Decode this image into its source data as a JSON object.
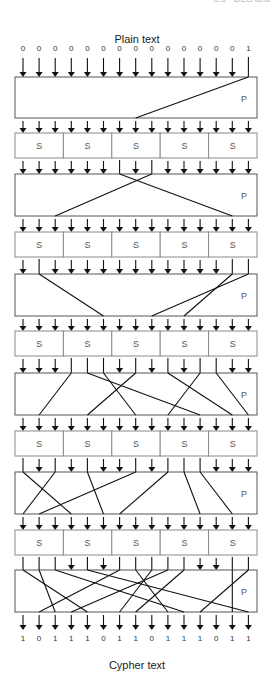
{
  "header": {
    "cut_text": "3.5 · DES and"
  },
  "diagram": {
    "title_top": "Plain text",
    "title_bottom": "Cypher text",
    "plaintext_bits": [
      "0",
      "0",
      "0",
      "0",
      "0",
      "0",
      "0",
      "0",
      "0",
      "0",
      "0",
      "0",
      "0",
      "0",
      "1"
    ],
    "cyphertext_bits": [
      "1",
      "0",
      "1",
      "1",
      "1",
      "0",
      "1",
      "1",
      "0",
      "1",
      "1",
      "1",
      "0",
      "1",
      "1"
    ],
    "sbox_label": "S",
    "pbox_label": "P",
    "wire_count": 15,
    "sboxes_per_round": 5,
    "rounds": [
      {
        "type": "P",
        "y": 77,
        "h": 41,
        "routes": [
          [
            14,
            7
          ]
        ]
      },
      {
        "type": "S",
        "y": 133,
        "h": 25
      },
      {
        "type": "P",
        "y": 174,
        "h": 42,
        "routes": [
          [
            6,
            13
          ],
          [
            8,
            2
          ]
        ]
      },
      {
        "type": "S",
        "y": 232,
        "h": 25
      },
      {
        "type": "P",
        "y": 274,
        "h": 42,
        "routes": [
          [
            1,
            5
          ],
          [
            13,
            10
          ],
          [
            14,
            8
          ]
        ]
      },
      {
        "type": "S",
        "y": 331,
        "h": 25
      },
      {
        "type": "P",
        "y": 373,
        "h": 42,
        "routes": [
          [
            3,
            1
          ],
          [
            4,
            11
          ],
          [
            5,
            7
          ],
          [
            7,
            4
          ],
          [
            9,
            13
          ],
          [
            11,
            9
          ],
          [
            12,
            14
          ]
        ]
      },
      {
        "type": "S",
        "y": 431,
        "h": 25
      },
      {
        "type": "P",
        "y": 472,
        "h": 42,
        "routes": [
          [
            0,
            3
          ],
          [
            2,
            0
          ],
          [
            4,
            5
          ],
          [
            7,
            1
          ],
          [
            9,
            6
          ],
          [
            10,
            11
          ],
          [
            11,
            13
          ]
        ]
      },
      {
        "type": "S",
        "y": 530,
        "h": 25
      },
      {
        "type": "P",
        "y": 570,
        "h": 42,
        "routes": [
          [
            0,
            4
          ],
          [
            1,
            2
          ],
          [
            2,
            10
          ],
          [
            4,
            14
          ],
          [
            6,
            1
          ],
          [
            7,
            9
          ],
          [
            8,
            6
          ],
          [
            9,
            3
          ],
          [
            10,
            7
          ],
          [
            13,
            13
          ],
          [
            14,
            11
          ]
        ]
      }
    ]
  }
}
